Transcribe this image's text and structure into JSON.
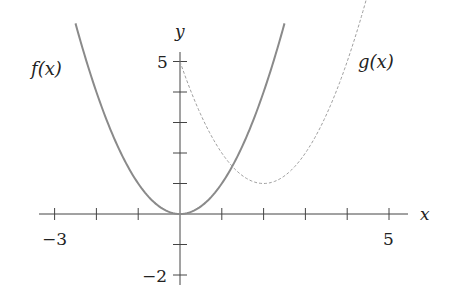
{
  "chart_data": {
    "type": "line",
    "title": "",
    "xlabel": "x",
    "ylabel": "y",
    "xlim": [
      -3.3,
      5.4
    ],
    "ylim": [
      -2.2,
      6.3
    ],
    "x_ticks": [
      -3,
      -2,
      -1,
      0,
      1,
      2,
      3,
      4,
      5
    ],
    "x_tick_labels": [
      {
        "value": -3,
        "label": "−3"
      },
      {
        "value": 5,
        "label": "5"
      }
    ],
    "y_ticks": [
      -2,
      -1,
      0,
      1,
      2,
      3,
      4,
      5
    ],
    "y_tick_labels": [
      {
        "value": 5,
        "label": "5"
      },
      {
        "value": -2,
        "label": "−2"
      }
    ],
    "grid": false,
    "series": [
      {
        "name": "f(x)",
        "expression": "x^2",
        "style": "solid",
        "color": "#8a8a8a",
        "x": [
          -2.5,
          -2,
          -1.5,
          -1,
          -0.5,
          0,
          0.5,
          1,
          1.5,
          2,
          2.5
        ],
        "y": [
          6.25,
          4,
          2.25,
          1,
          0.25,
          0,
          0.25,
          1,
          2.25,
          4,
          6.25
        ]
      },
      {
        "name": "g(x)",
        "expression": "(x-2)^2 + 1",
        "style": "dashed",
        "color": "#a0a0a0",
        "x": [
          0,
          0.5,
          1,
          1.5,
          2,
          2.5,
          3,
          3.5,
          4,
          4.5
        ],
        "y": [
          5,
          3.25,
          2,
          1.25,
          1,
          1.25,
          2,
          3.25,
          5,
          7.25
        ]
      }
    ],
    "annotations": [
      {
        "text": "f(x)",
        "position": "upper-left, next to left branch of f"
      },
      {
        "text": "g(x)",
        "position": "upper-right, next to right branch of g"
      }
    ]
  },
  "labels": {
    "x_axis": "x",
    "y_axis": "y",
    "x_min_tick": "−3",
    "x_max_tick": "5",
    "y_max_tick": "5",
    "y_min_tick": "−2",
    "f_label": "f(x)",
    "g_label": "g(x)"
  }
}
